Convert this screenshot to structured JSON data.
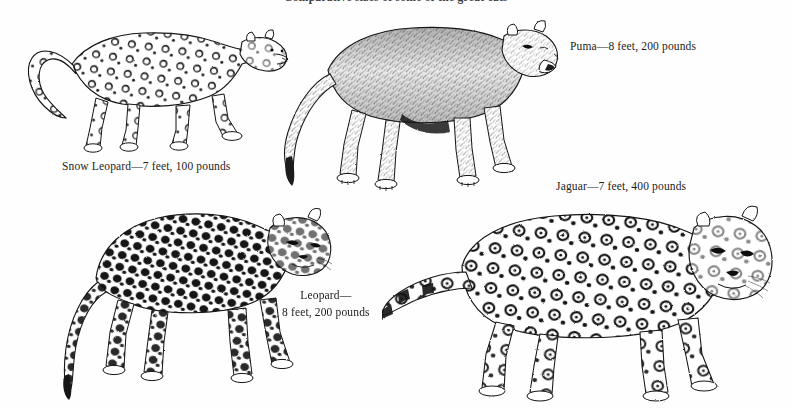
{
  "page": {
    "width": 792,
    "height": 409,
    "background_color": "#fefefe",
    "ink_color": "#111111",
    "running_title": "Comparative sizes of some of the great cats"
  },
  "captions": {
    "snow_leopard": "Snow Leopard—7 feet, 100 pounds",
    "puma": "Puma—8 feet, 200 pounds",
    "jaguar": "Jaguar—7 feet, 400 pounds",
    "leopard_line1": "Leopard—",
    "leopard_line2": "8 feet, 200 pounds"
  },
  "figures": [
    {
      "id": "snow-leopard",
      "name": "snow-leopard-illustration",
      "common_name": "Snow Leopard",
      "length": "7 feet",
      "weight": "100 pounds",
      "position": "top-left",
      "description": "Pen-and-ink drawing of a snow leopard walking to the right with a thick upcurved tail and open rosette spots"
    },
    {
      "id": "puma",
      "name": "puma-illustration",
      "common_name": "Puma",
      "length": "8 feet",
      "weight": "200 pounds",
      "position": "top-right",
      "description": "Pen-and-ink drawing of an unspotted puma standing and facing right with a long low-sweeping tail"
    },
    {
      "id": "leopard",
      "name": "leopard-illustration",
      "common_name": "Leopard",
      "length": "8 feet",
      "weight": "200 pounds",
      "position": "bottom-left",
      "description": "Pen-and-ink drawing of a densely spotted leopard with head turned toward the viewer"
    },
    {
      "id": "jaguar",
      "name": "jaguar-illustration",
      "common_name": "Jaguar",
      "length": "7 feet",
      "weight": "400 pounds",
      "position": "bottom-right",
      "description": "Pen-and-ink drawing of a stocky jaguar with large rosettes facing right, head toward the viewer"
    }
  ]
}
